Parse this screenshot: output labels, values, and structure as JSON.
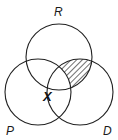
{
  "diagram": {
    "type": "venn",
    "sets": [
      {
        "name": "R",
        "cx": 59,
        "cy": 57,
        "r": 33
      },
      {
        "name": "P",
        "cx": 38,
        "cy": 92,
        "r": 33
      },
      {
        "name": "D",
        "cx": 80,
        "cy": 92,
        "r": 33
      }
    ],
    "labels": {
      "R": "R",
      "P": "P",
      "D": "D",
      "X": "X"
    },
    "shaded_region": "R ∩ D (excluding P)",
    "marked_point": {
      "label": "X",
      "region": "R ∩ P ∩ D"
    },
    "colors": {
      "stroke": "#222222",
      "hatch": "#222222",
      "background": "#ffffff"
    }
  }
}
